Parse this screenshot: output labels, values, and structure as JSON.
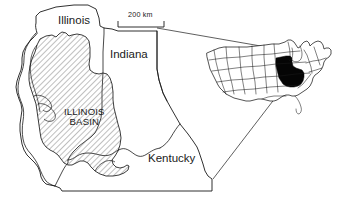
{
  "figure": {
    "kind": "geologic-locator-map",
    "background_color": "#ffffff",
    "line_color": "#1a1a1a",
    "highlight_color": "#050505"
  },
  "main_map": {
    "states": [
      {
        "id": "illinois",
        "label": "Illinois",
        "x": 58,
        "y": 14
      },
      {
        "id": "indiana",
        "label": "Indiana",
        "x": 110,
        "y": 48
      },
      {
        "id": "kentucky",
        "label": "Kentucky",
        "x": 148,
        "y": 152
      }
    ]
  },
  "basin": {
    "label_line1": "ILLINOIS",
    "label_line2": "BASIN",
    "x": 64,
    "y": 107,
    "fill_style": "diagonal-hatch"
  },
  "scale_bar": {
    "label": "200 km",
    "x": 124,
    "y": 11,
    "bar_x": 118,
    "bar_y": 25,
    "bar_length": 46
  },
  "inset_map": {
    "name": "united-states-locator-inset",
    "highlight_label": "Illinois Basin extent"
  }
}
